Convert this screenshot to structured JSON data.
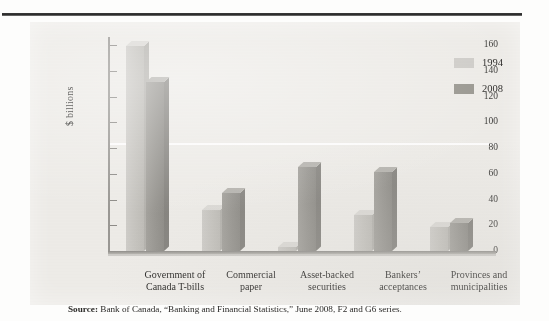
{
  "figure": {
    "source_prefix": "Source:",
    "source_text": " Bank of Canada, “Banking and Financial Statistics,” June 2008, F2 and G6 series."
  },
  "chart_data": {
    "type": "bar",
    "title": "",
    "xlabel": "",
    "ylabel": "$ billions",
    "ylim": [
      0,
      160
    ],
    "yticks": [
      0,
      20,
      40,
      60,
      80,
      100,
      120,
      140,
      160
    ],
    "ytick_labels": [
      "0",
      "20",
      "40",
      "60",
      "80",
      "100",
      "120",
      "140",
      "160"
    ],
    "grid": "single white gridline at 100",
    "legend_position": "top-right",
    "categories": [
      "Government of\nCanada T-bills",
      "Commercial\npaper",
      "Asset-backed\nsecurities",
      "Bankers’\nacceptances",
      "Provinces and\nmunicipalities"
    ],
    "category_lines": [
      [
        "Government of",
        "Canada T-bills"
      ],
      [
        "Commercial",
        "paper"
      ],
      [
        "Asset-backed",
        "securities"
      ],
      [
        "Bankers’",
        "acceptances"
      ],
      [
        "Provinces and",
        "municipalities"
      ]
    ],
    "series": [
      {
        "name": "1994",
        "color": "#cfcdc9",
        "values": [
          159,
          32,
          3,
          28,
          19
        ]
      },
      {
        "name": "2008",
        "color": "#98968f",
        "values": [
          131,
          45,
          65,
          61,
          22
        ]
      }
    ]
  },
  "legend": {
    "items": [
      {
        "label": "1994",
        "color": "#cfcdc9"
      },
      {
        "label": "2008",
        "color": "#98968f"
      }
    ]
  }
}
